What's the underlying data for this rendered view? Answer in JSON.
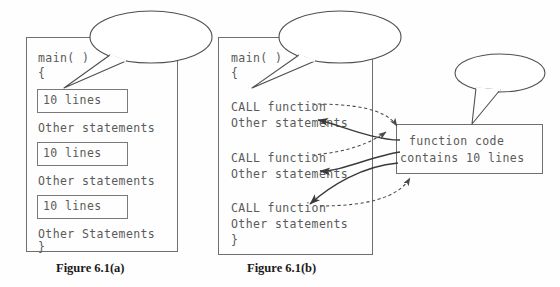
{
  "figure": {
    "captions": {
      "a": "Figure 6.1(a)",
      "b": "Figure 6.1(b)"
    }
  },
  "callouts": [
    {
      "id": "callout-repeated",
      "text": "Program with\nrepeated"
    },
    {
      "id": "callout-function",
      "text": "Program with\nfunction"
    },
    {
      "id": "callout-function-label",
      "text": "Function"
    }
  ],
  "program_a": {
    "name": "main-with-repeated-code",
    "header": "main( )",
    "open_brace": "{",
    "close_brace": "}",
    "lines": [
      {
        "kind": "boxed",
        "text": "10 lines"
      },
      {
        "kind": "plain",
        "text": "Other statements"
      },
      {
        "kind": "boxed",
        "text": "10 lines"
      },
      {
        "kind": "plain",
        "text": "Other statements"
      },
      {
        "kind": "boxed",
        "text": "10 lines"
      },
      {
        "kind": "plain",
        "text": "Other Statements"
      }
    ]
  },
  "program_b": {
    "name": "main-with-function-calls",
    "header": "main( )",
    "open_brace": "{",
    "close_brace": "}",
    "lines": [
      {
        "kind": "call",
        "text": "CALL function"
      },
      {
        "kind": "plain",
        "text": "Other statements"
      },
      {
        "kind": "call",
        "text": "CALL function"
      },
      {
        "kind": "plain",
        "text": "Other statements"
      },
      {
        "kind": "call",
        "text": "CALL function"
      },
      {
        "kind": "plain",
        "text": "Other statements"
      }
    ]
  },
  "function_box": {
    "line1": "function code",
    "line2": "contains 10 lines"
  },
  "colors": {
    "stroke": "#6f6f6f",
    "text": "#5a5a5a",
    "caption": "#1b1b1b",
    "arrow_call": "#4a4a4a",
    "arrow_return": "#3a3a3a",
    "background": "#fefefe"
  }
}
